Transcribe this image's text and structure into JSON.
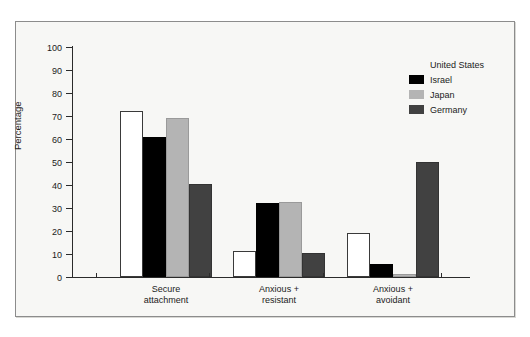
{
  "chart_data": {
    "type": "bar",
    "title": "",
    "xlabel": "",
    "ylabel": "Percentage",
    "ylim": [
      0,
      100
    ],
    "ytick_labels": [
      "100",
      "90",
      "80",
      "70",
      "60",
      "50",
      "40",
      "30",
      "20",
      "10",
      "0"
    ],
    "ytick_values": [
      100,
      90,
      80,
      70,
      60,
      50,
      40,
      30,
      20,
      10,
      0
    ],
    "grid": false,
    "legend_position": "top-right",
    "categories": [
      "Secure attachment",
      "Anxious + resistant",
      "Anxious + avoidant"
    ],
    "category_lines": [
      [
        "Secure",
        "attachment"
      ],
      [
        "Anxious +",
        "resistant"
      ],
      [
        "Anxious +",
        "avoidant"
      ]
    ],
    "series": [
      {
        "name": "United States",
        "color": "#ffffff",
        "values": [
          72,
          11.5,
          19
        ]
      },
      {
        "name": "Israel",
        "color": "#000000",
        "values": [
          61,
          32,
          5.5
        ]
      },
      {
        "name": "Japan",
        "color": "#b4b4b4",
        "values": [
          69,
          32.5,
          1.5
        ]
      },
      {
        "name": "Germany",
        "color": "#414141",
        "values": [
          40.5,
          10.5,
          50
        ]
      }
    ]
  },
  "legend": {
    "entries": [
      {
        "label": "United States",
        "swatch": "us"
      },
      {
        "label": "Israel",
        "swatch": "israel"
      },
      {
        "label": "Japan",
        "swatch": "japan"
      },
      {
        "label": "Germany",
        "swatch": "germany"
      }
    ]
  }
}
